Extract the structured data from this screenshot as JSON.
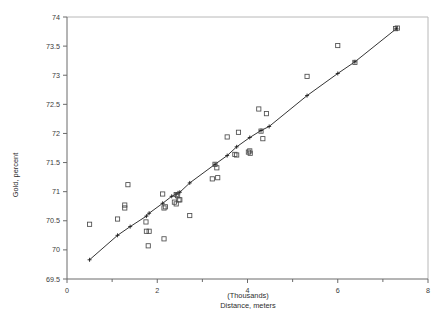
{
  "chart_data": {
    "type": "scatter",
    "title": "",
    "xlabel": "Distance, meters",
    "xlabel_units": "(Thousands)",
    "ylabel": "Gold, percent",
    "xlim": [
      0,
      8
    ],
    "ylim": [
      69.5,
      74
    ],
    "xticks": [
      0,
      2,
      4,
      6,
      8
    ],
    "xtick_labels": [
      "0",
      "2",
      "4",
      "6",
      "8"
    ],
    "xticks_minor": [
      1,
      3,
      5,
      7
    ],
    "yticks": [
      69.5,
      70,
      70.5,
      71,
      71.5,
      72,
      72.5,
      73,
      73.5,
      74
    ],
    "ytick_labels": [
      "69.5",
      "70",
      "70.5",
      "71",
      "71.5",
      "72",
      "72.5",
      "73",
      "73.5",
      "74"
    ],
    "grid": false,
    "legend": null,
    "marker": "open-square",
    "series": [
      {
        "name": "observations",
        "marker": "open-square",
        "points": [
          [
            0.5,
            70.44
          ],
          [
            1.12,
            70.53
          ],
          [
            1.28,
            70.77
          ],
          [
            1.28,
            70.72
          ],
          [
            1.35,
            71.12
          ],
          [
            1.75,
            70.48
          ],
          [
            1.76,
            70.32
          ],
          [
            1.82,
            70.32
          ],
          [
            1.8,
            70.07
          ],
          [
            2.12,
            70.96
          ],
          [
            2.15,
            70.72
          ],
          [
            2.18,
            70.74
          ],
          [
            2.15,
            70.19
          ],
          [
            2.38,
            70.82
          ],
          [
            2.42,
            70.95
          ],
          [
            2.45,
            70.93
          ],
          [
            2.42,
            70.79
          ],
          [
            2.48,
            70.86
          ],
          [
            2.5,
            70.86
          ],
          [
            2.72,
            70.59
          ],
          [
            3.22,
            71.22
          ],
          [
            3.28,
            71.47
          ],
          [
            3.32,
            71.41
          ],
          [
            3.34,
            71.24
          ],
          [
            3.55,
            71.94
          ],
          [
            3.72,
            71.64
          ],
          [
            3.76,
            71.63
          ],
          [
            3.8,
            72.02
          ],
          [
            4.02,
            71.68
          ],
          [
            4.05,
            71.7
          ],
          [
            4.06,
            71.66
          ],
          [
            4.25,
            72.42
          ],
          [
            4.3,
            72.04
          ],
          [
            4.34,
            71.91
          ],
          [
            4.42,
            72.34
          ],
          [
            5.32,
            72.98
          ],
          [
            6.0,
            73.51
          ],
          [
            6.38,
            73.22
          ],
          [
            7.28,
            73.8
          ],
          [
            7.32,
            73.81
          ]
        ]
      },
      {
        "name": "fitted-line",
        "marker": "plus-cross",
        "points": [
          [
            0.5,
            69.83
          ],
          [
            1.12,
            70.25
          ],
          [
            1.4,
            70.4
          ],
          [
            1.76,
            70.58
          ],
          [
            1.82,
            70.63
          ],
          [
            2.12,
            70.8
          ],
          [
            2.32,
            70.92
          ],
          [
            2.42,
            70.96
          ],
          [
            2.46,
            70.98
          ],
          [
            2.5,
            70.99
          ],
          [
            2.72,
            71.15
          ],
          [
            3.28,
            71.47
          ],
          [
            3.55,
            71.62
          ],
          [
            3.76,
            71.77
          ],
          [
            4.05,
            71.93
          ],
          [
            4.3,
            72.05
          ],
          [
            4.48,
            72.12
          ],
          [
            5.32,
            72.65
          ],
          [
            6.0,
            73.03
          ],
          [
            6.38,
            73.23
          ],
          [
            7.3,
            73.8
          ]
        ]
      }
    ]
  },
  "axes": {
    "y_title": "Gold, percent",
    "x_title": "Distance, meters",
    "x_units": "(Thousands)"
  }
}
